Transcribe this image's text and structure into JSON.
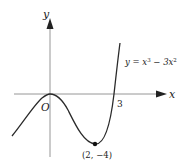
{
  "diagram": {
    "type": "function-graph",
    "axes": {
      "x_label": "x",
      "y_label": "y",
      "origin_label": "O"
    },
    "equation": {
      "lhs": "y = x",
      "exp1": "3",
      "mid": " − 3x",
      "exp2": "2"
    },
    "annotations": {
      "x_intercept": "3",
      "minimum_point": "(2, −4)"
    },
    "colors": {
      "axis": "#8a8a8a",
      "curve": "#2a2a2a",
      "text": "#222222"
    }
  }
}
